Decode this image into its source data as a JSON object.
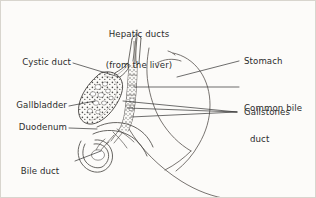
{
  "figure": {
    "background_color": "#fcfbf9",
    "border_color": "#d8d5ce",
    "ink_color": "#3a3a3a",
    "text_color": "#2b2b2b"
  },
  "labels": {
    "hepatic_ducts": {
      "line1": "Hepatic ducts",
      "line2": "(from the liver)"
    },
    "cystic_duct": "Cystic duct",
    "gallbladder": "Gallbladder",
    "duodenum": "Duodenum",
    "bile_duct_opening": {
      "line1": "Bile duct",
      "line2": "opens into",
      "line3": "duodenum"
    },
    "stomach": "Stomach",
    "common_bile_duct": {
      "line1": "Common bile",
      "line2": "duct"
    },
    "gallstones": "Gallstones"
  },
  "structures": {
    "gallbladder_icon": "gallbladder-organ",
    "stomach_icon": "stomach-organ",
    "duodenum_icon": "duodenum-organ",
    "hepatic_duct_icon": "hepatic-duct-branch",
    "cystic_duct_icon": "cystic-duct",
    "common_bile_duct_icon": "common-bile-duct",
    "gallstones_icon": "gallstones-cluster"
  }
}
